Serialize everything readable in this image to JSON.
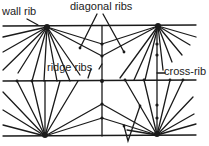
{
  "labels": {
    "wall_rib": "wall rib",
    "diagonal_ribs": "diagonal ribs",
    "ridge_ribs": "ridge ribs",
    "cross_rib": "cross-rib"
  },
  "colors": {
    "stroke": "#1a1a1a",
    "background": "#ffffff"
  }
}
